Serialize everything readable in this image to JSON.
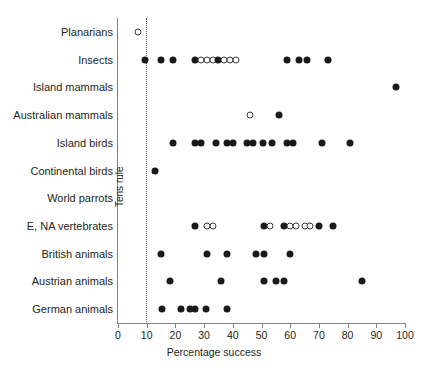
{
  "chart_data": {
    "type": "scatter",
    "title": "",
    "xlabel": "Percentage success",
    "ylabel": "",
    "xlim": [
      0,
      100
    ],
    "xticks": [
      0,
      10,
      20,
      30,
      40,
      50,
      60,
      70,
      80,
      90,
      100
    ],
    "xtick_labels": [
      "0",
      "10",
      "20",
      "30",
      "40",
      "50",
      "60",
      "70",
      "80",
      "90",
      "100"
    ],
    "grid": false,
    "legend": null,
    "annotations": [
      {
        "name": "tens-rule",
        "text": "Tens rule",
        "type": "vertical-reference-line",
        "x": 10,
        "style": "dotted",
        "color": "#58595b"
      }
    ],
    "marker_styles": {
      "filled": {
        "label": "filled circle",
        "color": "#1a1a1a"
      },
      "open": {
        "label": "open circle",
        "color": "#ffffff",
        "edge": "#3b3b3b"
      }
    },
    "categories": [
      "Planarians",
      "Insects",
      "Island mammals",
      "Australian mammals",
      "Island birds",
      "Continental birds",
      "World parrots",
      "E, NA vertebrates",
      "British animals",
      "Austrian animals",
      "German animals"
    ],
    "series": [
      {
        "name": "Planarians",
        "points": [
          {
            "x": 7,
            "marker": "open"
          }
        ]
      },
      {
        "name": "Insects",
        "points": [
          {
            "x": 9.5,
            "marker": "filled"
          },
          {
            "x": 15,
            "marker": "filled"
          },
          {
            "x": 19,
            "marker": "filled"
          },
          {
            "x": 27,
            "marker": "filled"
          },
          {
            "x": 29,
            "marker": "open"
          },
          {
            "x": 31,
            "marker": "open"
          },
          {
            "x": 33,
            "marker": "open"
          },
          {
            "x": 35,
            "marker": "filled"
          },
          {
            "x": 37,
            "marker": "open"
          },
          {
            "x": 39,
            "marker": "open"
          },
          {
            "x": 41,
            "marker": "open"
          },
          {
            "x": 59,
            "marker": "filled"
          },
          {
            "x": 63,
            "marker": "filled"
          },
          {
            "x": 66,
            "marker": "filled"
          },
          {
            "x": 73,
            "marker": "filled"
          }
        ]
      },
      {
        "name": "Island mammals",
        "points": [
          {
            "x": 97,
            "marker": "filled"
          }
        ]
      },
      {
        "name": "Australian mammals",
        "points": [
          {
            "x": 46,
            "marker": "open"
          },
          {
            "x": 56,
            "marker": "filled"
          }
        ]
      },
      {
        "name": "Island birds",
        "points": [
          {
            "x": 19,
            "marker": "filled"
          },
          {
            "x": 27,
            "marker": "filled"
          },
          {
            "x": 29,
            "marker": "filled"
          },
          {
            "x": 34,
            "marker": "filled"
          },
          {
            "x": 38,
            "marker": "filled"
          },
          {
            "x": 40,
            "marker": "filled"
          },
          {
            "x": 45,
            "marker": "filled"
          },
          {
            "x": 47,
            "marker": "filled"
          },
          {
            "x": 50.5,
            "marker": "filled"
          },
          {
            "x": 53.5,
            "marker": "filled"
          },
          {
            "x": 59,
            "marker": "filled"
          },
          {
            "x": 61,
            "marker": "filled"
          },
          {
            "x": 71,
            "marker": "filled"
          },
          {
            "x": 81,
            "marker": "filled"
          }
        ]
      },
      {
        "name": "Continental birds",
        "points": [
          {
            "x": 13,
            "marker": "filled"
          }
        ]
      },
      {
        "name": "World parrots",
        "points": []
      },
      {
        "name": "E, NA vertebrates",
        "points": [
          {
            "x": 27,
            "marker": "filled"
          },
          {
            "x": 31,
            "marker": "open"
          },
          {
            "x": 33,
            "marker": "open"
          },
          {
            "x": 51,
            "marker": "filled"
          },
          {
            "x": 53,
            "marker": "open"
          },
          {
            "x": 58,
            "marker": "filled"
          },
          {
            "x": 60,
            "marker": "open"
          },
          {
            "x": 62,
            "marker": "open"
          },
          {
            "x": 65,
            "marker": "open"
          },
          {
            "x": 67,
            "marker": "open"
          },
          {
            "x": 70,
            "marker": "filled"
          },
          {
            "x": 75,
            "marker": "filled"
          }
        ]
      },
      {
        "name": "British animals",
        "points": [
          {
            "x": 15,
            "marker": "filled"
          },
          {
            "x": 31,
            "marker": "filled"
          },
          {
            "x": 38,
            "marker": "filled"
          },
          {
            "x": 48,
            "marker": "filled"
          },
          {
            "x": 51,
            "marker": "filled"
          },
          {
            "x": 60,
            "marker": "filled"
          }
        ]
      },
      {
        "name": "Austrian animals",
        "points": [
          {
            "x": 18,
            "marker": "filled"
          },
          {
            "x": 36,
            "marker": "filled"
          },
          {
            "x": 51,
            "marker": "filled"
          },
          {
            "x": 55,
            "marker": "filled"
          },
          {
            "x": 58,
            "marker": "filled"
          },
          {
            "x": 85,
            "marker": "filled"
          }
        ]
      },
      {
        "name": "German animals",
        "points": [
          {
            "x": 15.5,
            "marker": "filled"
          },
          {
            "x": 22,
            "marker": "filled"
          },
          {
            "x": 25,
            "marker": "filled"
          },
          {
            "x": 27,
            "marker": "filled"
          },
          {
            "x": 30.5,
            "marker": "filled"
          },
          {
            "x": 38,
            "marker": "filled"
          }
        ]
      }
    ]
  }
}
